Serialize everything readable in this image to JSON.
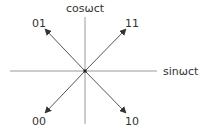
{
  "diagram": {
    "type": "constellation",
    "axes": {
      "vertical_label": "cosωct",
      "horizontal_label": "sinωct"
    },
    "points": [
      {
        "label": "01",
        "quadrant": "upper-left"
      },
      {
        "label": "11",
        "quadrant": "upper-right"
      },
      {
        "label": "00",
        "quadrant": "lower-left"
      },
      {
        "label": "10",
        "quadrant": "lower-right"
      }
    ],
    "colors": {
      "axis": "#9a9a9a",
      "arrow": "#555555",
      "text": "#333333",
      "background": "#ffffff"
    }
  }
}
